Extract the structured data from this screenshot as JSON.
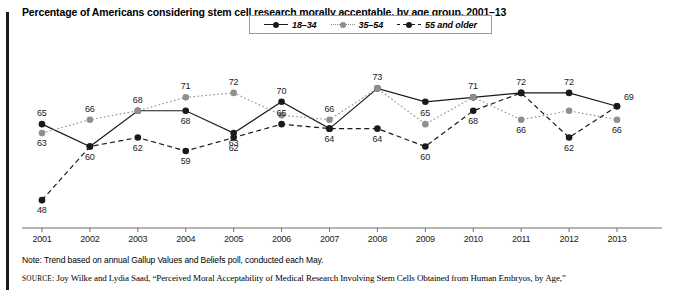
{
  "title": "Percentage of Americans considering stem cell research morally acceptable, by age group, 2001–13",
  "note": "Note: Trend based on annual Gallup Values and Beliefs poll, conducted each May.",
  "source": {
    "prefix": "SOURCE",
    "text": ": Joy Wilke and Lydia Saad, “Perceived Moral Acceptability of Medical Research Involving Stem Cells Obtained from Human Embryos, by Age,”"
  },
  "legend": {
    "items": [
      {
        "label": "18–34",
        "color": "#1a1a1a",
        "style": "solid"
      },
      {
        "label": "35–54",
        "color": "#8f8f8f",
        "style": "dotted"
      },
      {
        "label": "55 and older",
        "color": "#1a1a1a",
        "style": "dashed"
      }
    ]
  },
  "chart_data": {
    "type": "line",
    "title": "Percentage of Americans considering stem cell research morally acceptable, by age group, 2001–13",
    "xlabel": "",
    "ylabel": "",
    "x": [
      2001,
      2002,
      2003,
      2004,
      2005,
      2006,
      2007,
      2008,
      2009,
      2010,
      2011,
      2012,
      2013
    ],
    "categories": [
      "2001",
      "2002",
      "2003",
      "2004",
      "2005",
      "2006",
      "2007",
      "2008",
      "2009",
      "2010",
      "2011",
      "2012",
      "2013"
    ],
    "ylim": [
      44,
      76
    ],
    "grid": false,
    "legend_position": "top-center",
    "series": [
      {
        "name": "18–34",
        "color": "#1a1a1a",
        "style": "solid",
        "values": [
          65,
          60,
          68,
          68,
          63,
          70,
          64,
          73,
          70,
          71,
          72,
          72,
          69
        ],
        "labels": [
          "65",
          "60",
          "68",
          "68",
          "63",
          "70",
          "64",
          "73",
          "",
          "71",
          "72",
          "72",
          "69"
        ]
      },
      {
        "name": "35–54",
        "color": "#8f8f8f",
        "style": "dotted",
        "values": [
          63,
          66,
          68,
          71,
          72,
          67,
          66,
          73,
          65,
          71,
          66,
          68,
          66
        ],
        "labels": [
          "63",
          "66",
          "",
          "71",
          "72",
          "",
          "66",
          "",
          "65",
          "",
          "66",
          "",
          "66"
        ]
      },
      {
        "name": "55 and older",
        "color": "#1a1a1a",
        "style": "dashed",
        "values": [
          48,
          60,
          62,
          59,
          62,
          65,
          64,
          64,
          60,
          68,
          72,
          62,
          69
        ],
        "labels": [
          "48",
          "",
          "62",
          "59",
          "62",
          "65",
          "",
          "64",
          "60",
          "68",
          "",
          "62",
          ""
        ]
      }
    ]
  }
}
